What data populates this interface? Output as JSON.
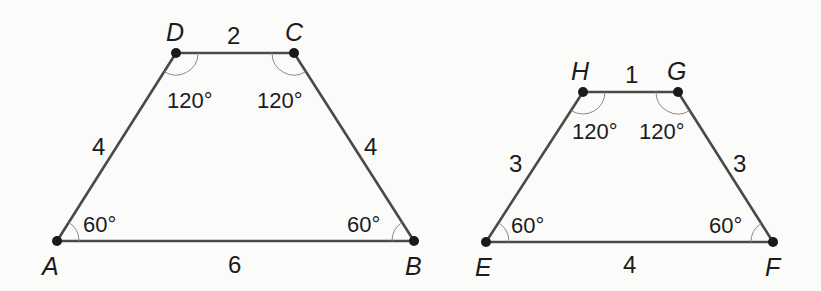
{
  "figures": [
    {
      "name": "trapezoid-ABCD",
      "vertices": {
        "A": {
          "label": "A",
          "x": 57,
          "y": 241
        },
        "B": {
          "label": "B",
          "x": 414,
          "y": 241
        },
        "C": {
          "label": "C",
          "x": 294,
          "y": 53
        },
        "D": {
          "label": "D",
          "x": 176,
          "y": 53
        }
      },
      "sides": {
        "AB": "6",
        "BC": "4",
        "CD": "2",
        "DA": "4"
      },
      "angles": {
        "A": "60°",
        "B": "60°",
        "C": "120°",
        "D": "120°"
      }
    },
    {
      "name": "trapezoid-EFGH",
      "vertices": {
        "E": {
          "label": "E",
          "x": 486,
          "y": 242
        },
        "F": {
          "label": "F",
          "x": 773,
          "y": 242
        },
        "G": {
          "label": "G",
          "x": 678,
          "y": 92
        },
        "H": {
          "label": "H",
          "x": 583,
          "y": 92
        }
      },
      "sides": {
        "EF": "4",
        "FG": "3",
        "GH": "1",
        "HE": "3"
      },
      "angles": {
        "E": "60°",
        "F": "60°",
        "G": "120°",
        "H": "120°"
      }
    }
  ]
}
